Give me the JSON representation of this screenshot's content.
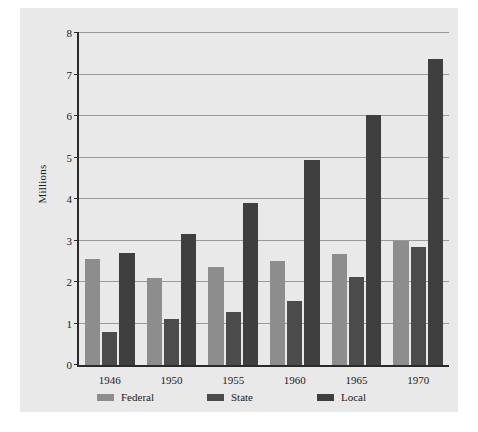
{
  "chart_data": {
    "type": "bar",
    "title": "",
    "xlabel": "",
    "ylabel": "Millions",
    "categories": [
      "1946",
      "1950",
      "1955",
      "1960",
      "1965",
      "1970"
    ],
    "series": [
      {
        "name": "Federal",
        "color": "#8d8d8d",
        "values": [
          2.55,
          2.1,
          2.35,
          2.5,
          2.67,
          2.98
        ]
      },
      {
        "name": "State",
        "color": "#4b4b4b",
        "values": [
          0.8,
          1.12,
          1.28,
          1.55,
          2.12,
          2.85
        ]
      },
      {
        "name": "Local",
        "color": "#3f3f3f",
        "values": [
          2.7,
          3.15,
          3.9,
          4.93,
          6.03,
          7.38
        ]
      }
    ],
    "ylim": [
      0,
      8
    ],
    "yticks": [
      0,
      1,
      2,
      3,
      4,
      5,
      6,
      7,
      8
    ],
    "ytick_labels": [
      "0",
      "1",
      "2",
      "3",
      "4",
      "5",
      "6",
      "7",
      "8"
    ],
    "grid": true,
    "legend_position": "bottom"
  },
  "figure": {
    "background_color": "#e9e9e9",
    "axis_color": "#2a2a2a",
    "gridline_color": "#9a9a9a",
    "text_color": "#1a1a1a"
  }
}
